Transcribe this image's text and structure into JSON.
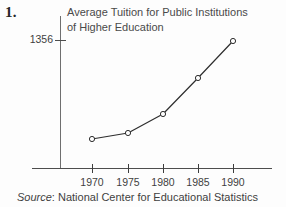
{
  "item_number": "1.",
  "source": {
    "label": "Source",
    "separator": ":",
    "text": "National Center for Educational Statistics"
  },
  "style": {
    "line_color": "#2e2e2e",
    "marker_fill": "#fdfdfd",
    "marker_stroke": "#2e2e2e",
    "axis_color": "#4d4d4d",
    "text_color": "#3f3f3f",
    "background": "#fdfdfd"
  },
  "chart_data": {
    "type": "line",
    "title": "Average Tuition for Public Institutions\nof Higher Education",
    "xlabel": "",
    "ylabel": "",
    "grid": false,
    "legend": false,
    "categories": [
      "1970",
      "1975",
      "1980",
      "1985",
      "1990"
    ],
    "x": [
      1970,
      1975,
      1980,
      1985,
      1990
    ],
    "xlim": [
      1967.5,
      1992.5
    ],
    "ylim": [
      0,
      1600
    ],
    "ytick_labels": [
      "1356"
    ],
    "yticks": [
      1356
    ],
    "series": [
      {
        "name": "Average tuition",
        "values": [
          323,
          382,
          583,
          971,
          1356
        ],
        "points_px": [
          {
            "x": 92,
            "y": 139
          },
          {
            "x": 128,
            "y": 133
          },
          {
            "x": 163,
            "y": 114
          },
          {
            "x": 198,
            "y": 78
          },
          {
            "x": 233,
            "y": 41
          }
        ]
      }
    ],
    "xtick_px": [
      92,
      128,
      163,
      198,
      233
    ],
    "ytick_px": [
      40
    ]
  }
}
